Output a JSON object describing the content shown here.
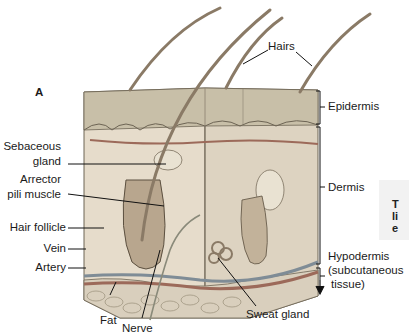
{
  "figure": {
    "panel_label": "A",
    "labels": {
      "hairs": "Hairs",
      "epidermis": "Epidermis",
      "dermis": "Dermis",
      "hypodermis_1": "Hypodermis",
      "hypodermis_2": "(subcutaneous",
      "hypodermis_3": "tissue)",
      "sebaceous_1": "Sebaceous",
      "sebaceous_2": "gland",
      "arrector_1": "Arrector",
      "arrector_2": "pili muscle",
      "hair_follicle": "Hair follicle",
      "vein": "Vein",
      "artery": "Artery",
      "fat": "Fat",
      "nerve": "Nerve",
      "sweat_gland": "Sweat gland"
    },
    "side_caption": [
      "T",
      "li",
      "e"
    ],
    "colors": {
      "epidermis": "#c8bfa8",
      "dermis": "#e6dccb",
      "hypodermis": "#d9cfbd",
      "hair": "#8a7a66",
      "vessel_red": "#9c6a5a",
      "vessel_blue": "#7f8c96"
    }
  }
}
